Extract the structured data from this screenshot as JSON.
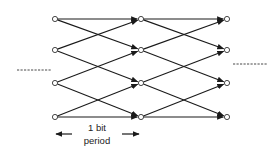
{
  "states": 4,
  "stages": 3,
  "transitions": [
    {
      "from": 0,
      "to": 0
    },
    {
      "from": 0,
      "to": 1
    },
    {
      "from": 1,
      "to": 0
    },
    {
      "from": 1,
      "to": 2
    },
    {
      "from": 2,
      "to": 1
    },
    {
      "from": 2,
      "to": 3
    },
    {
      "from": 3,
      "to": 2
    },
    {
      "from": 3,
      "to": 3
    }
  ],
  "continuation_marks": [
    "left",
    "right"
  ],
  "period_label": {
    "line1": "1 bit",
    "line2": "period"
  },
  "colors": {
    "line": "#1a1a1a",
    "node_fill": "#ffffff"
  }
}
